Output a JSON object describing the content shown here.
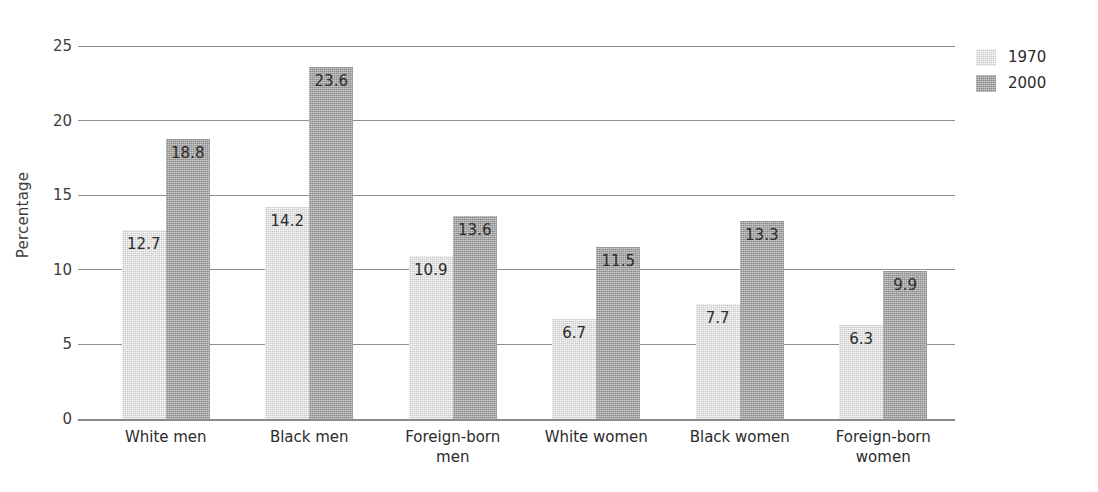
{
  "chart_data": {
    "type": "bar",
    "title": "",
    "subtitle": "",
    "xlabel": "",
    "ylabel": "Percentage",
    "ylim": [
      0,
      25
    ],
    "yticks": [
      0,
      5,
      10,
      15,
      20,
      25
    ],
    "ytick_labels": [
      "0",
      "5",
      "10",
      "15",
      "20",
      "25"
    ],
    "grid": true,
    "grid_axis": "y",
    "legend_position": "top-right",
    "orientation": "vertical",
    "grouping": "clustered",
    "categories": [
      "White men",
      "Black men",
      "Foreign-born men",
      "White women",
      "Black women",
      "Foreign-born women"
    ],
    "category_lines": [
      [
        "White men"
      ],
      [
        "Black men"
      ],
      [
        "Foreign-born",
        "men"
      ],
      [
        "White women"
      ],
      [
        "Black women"
      ],
      [
        "Foreign-born",
        "women"
      ]
    ],
    "series": [
      {
        "name": "1970",
        "color": "#d6d6d6",
        "values": [
          12.7,
          14.2,
          10.9,
          6.7,
          7.7,
          6.3
        ],
        "labels": [
          "12.7",
          "14.2",
          "10.9",
          "6.7",
          "7.7",
          "6.3"
        ]
      },
      {
        "name": "2000",
        "color": "#999999",
        "values": [
          18.8,
          23.6,
          13.6,
          11.5,
          13.3,
          9.9
        ],
        "labels": [
          "18.8",
          "23.6",
          "13.6",
          "11.5",
          "13.3",
          "9.9"
        ]
      }
    ],
    "data_labels_shown": true,
    "data_label_position": "inside-top"
  },
  "legend": {
    "entries": [
      {
        "label": "1970",
        "series_index": 0
      },
      {
        "label": "2000",
        "series_index": 1
      }
    ]
  },
  "axes": {
    "y_title": "Percentage"
  },
  "colors": {
    "series_1970": "#d6d6d6",
    "series_2000": "#999999",
    "gridline": "#8e8e8e",
    "text": "#2b2b2b",
    "background": "#ffffff"
  }
}
